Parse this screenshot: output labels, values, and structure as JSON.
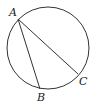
{
  "diagram": {
    "title": "",
    "stroke_color": "#333333",
    "circle": {
      "cx": 48,
      "cy": 48,
      "r": 41
    },
    "points": {
      "A": {
        "label": "A",
        "x": 18,
        "y": 19
      },
      "B": {
        "label": "B",
        "x": 40,
        "y": 89
      },
      "C": {
        "label": "C",
        "x": 78,
        "y": 76
      }
    },
    "segments": [
      {
        "from": "A",
        "to": "B"
      },
      {
        "from": "A",
        "to": "C"
      }
    ]
  }
}
